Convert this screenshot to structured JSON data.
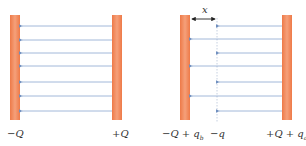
{
  "colors": {
    "plate": "#f08050",
    "plate_highlight": "#f5a680",
    "field_line": "#7a9cc8",
    "dimension": "#222222",
    "dielectric_line": "#b8c4d8",
    "label": "#333333"
  },
  "left_diagram": {
    "labels": {
      "left_plate": "−Q",
      "right_plate": "+Q"
    },
    "field_lines_count": 7
  },
  "right_diagram": {
    "labels": {
      "dimension": "x",
      "left_plate": "−Q + q",
      "left_plate_sub": "b",
      "induced": "−q",
      "right_plate": "+Q + q",
      "right_plate_sub": "a"
    },
    "long_field_lines": 3,
    "short_field_lines": 4
  }
}
